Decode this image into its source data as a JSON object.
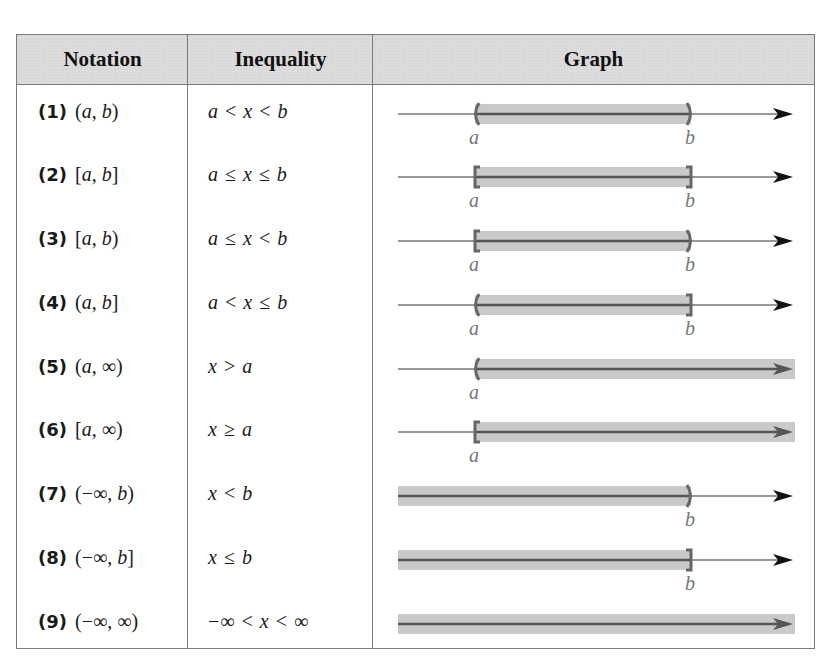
{
  "table": {
    "headers": [
      "Notation",
      "Inequality",
      "Graph"
    ],
    "rows": [
      {
        "num": "(1)",
        "notation": "(a, b)",
        "inequality": "a < x < b",
        "graph": {
          "left": "(",
          "right": ")",
          "left_label": "a",
          "right_label": "b",
          "shade": "a-to-b"
        }
      },
      {
        "num": "(2)",
        "notation": "[a, b]",
        "inequality": "a ≤ x ≤ b",
        "graph": {
          "left": "[",
          "right": "]",
          "left_label": "a",
          "right_label": "b",
          "shade": "a-to-b"
        }
      },
      {
        "num": "(3)",
        "notation": "[a, b)",
        "inequality": "a ≤ x < b",
        "graph": {
          "left": "[",
          "right": ")",
          "left_label": "a",
          "right_label": "b",
          "shade": "a-to-b"
        }
      },
      {
        "num": "(4)",
        "notation": "(a, b]",
        "inequality": "a < x ≤ b",
        "graph": {
          "left": "(",
          "right": "]",
          "left_label": "a",
          "right_label": "b",
          "shade": "a-to-b"
        }
      },
      {
        "num": "(5)",
        "notation": "(a, ∞)",
        "inequality": "x > a",
        "graph": {
          "left": "(",
          "right": null,
          "left_label": "a",
          "right_label": null,
          "shade": "a-to-inf"
        }
      },
      {
        "num": "(6)",
        "notation": "[a, ∞)",
        "inequality": "x ≥ a",
        "graph": {
          "left": "[",
          "right": null,
          "left_label": "a",
          "right_label": null,
          "shade": "a-to-inf"
        }
      },
      {
        "num": "(7)",
        "notation": "(−∞, b)",
        "inequality": "x < b",
        "graph": {
          "left": null,
          "right": ")",
          "left_label": null,
          "right_label": "b",
          "shade": "neg-inf-to-b"
        }
      },
      {
        "num": "(8)",
        "notation": "(−∞, b]",
        "inequality": "x ≤ b",
        "graph": {
          "left": null,
          "right": "]",
          "left_label": null,
          "right_label": "b",
          "shade": "neg-inf-to-b"
        }
      },
      {
        "num": "(9)",
        "notation": "(−∞, ∞)",
        "inequality": "−∞ < x < ∞",
        "graph": {
          "left": null,
          "right": null,
          "left_label": null,
          "right_label": null,
          "shade": "all"
        }
      }
    ]
  },
  "colors": {
    "header_bg": "#dcdcdc",
    "border": "#7a7a7a",
    "shade": "#c9c9c9",
    "shade_line": "#555555",
    "axis": "#333333",
    "label": "#777777"
  }
}
